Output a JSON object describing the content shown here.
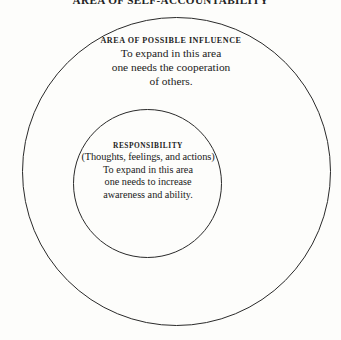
{
  "figure": {
    "title": "AREA OF SELF-ACCOUNTABILITY",
    "background_color": "#fdfdfb",
    "line_color": "#2a2a2a",
    "text_color": "#1a1a1a"
  },
  "outer_zone": {
    "heading": "AREA OF POSSIBLE INFLUENCE",
    "lines": [
      "To expand in this area",
      "one needs the cooperation",
      "of others."
    ]
  },
  "inner_zone": {
    "heading": "RESPONSIBILITY",
    "subtitle": "(Thoughts, feelings, and actions)",
    "lines": [
      "To expand in this area",
      "one needs to increase",
      "awareness and ability."
    ]
  }
}
